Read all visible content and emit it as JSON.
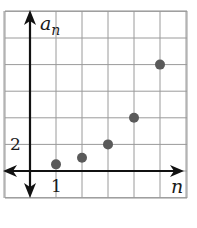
{
  "chart_data": {
    "type": "scatter",
    "title": "",
    "xlabel": "n",
    "ylabel": "a_n",
    "ylabel_base": "a",
    "ylabel_sub": "n",
    "x": [
      1,
      2,
      3,
      4,
      5
    ],
    "values": [
      0.5,
      1,
      2,
      4,
      8
    ],
    "x_tick_labels": [
      {
        "value": 1,
        "label": "1"
      }
    ],
    "y_tick_labels": [
      {
        "value": 2,
        "label": "2"
      }
    ],
    "xlim": [
      -1,
      6
    ],
    "ylim": [
      -2,
      12
    ],
    "grid": true,
    "x_grid_step": 1,
    "y_grid_step": 2,
    "legend": null
  },
  "colors": {
    "grid": "#9a9a9a",
    "axis": "#111111",
    "point": "#5a5a5a",
    "background": "#ffffff"
  }
}
